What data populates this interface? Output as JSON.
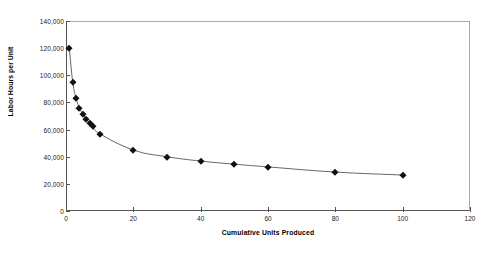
{
  "chart_data": {
    "type": "line",
    "title": "",
    "subtitle": "",
    "xlabel": "Cumulative Units Produced",
    "ylabel": "Labor Hours per Unit",
    "xlim": [
      0,
      120
    ],
    "ylim": [
      0,
      140000
    ],
    "xticks": [
      0,
      20,
      40,
      60,
      80,
      100,
      120
    ],
    "xtick_labels": [
      "0",
      "20",
      "40",
      "60",
      "80",
      "100",
      "120"
    ],
    "yticks": [
      0,
      20000,
      40000,
      60000,
      80000,
      100000,
      120000,
      140000
    ],
    "ytick_labels": [
      "0",
      "20,000",
      "40,000",
      "60,000",
      "80,000",
      "100,000",
      "120,000",
      "140,000"
    ],
    "grid": false,
    "legend": null,
    "legend_position": "none",
    "marker": "diamond",
    "marker_color": "#111111",
    "line_color": "#555555",
    "series": [
      {
        "name": "Labor Hours per Unit",
        "x": [
          1,
          2,
          3,
          4,
          5,
          6,
          7,
          8,
          10,
          20,
          30,
          40,
          50,
          60,
          80,
          100
        ],
        "values": [
          120000,
          95000,
          83000,
          76000,
          71500,
          68000,
          65000,
          62500,
          57000,
          45000,
          40000,
          36800,
          34500,
          32500,
          28700,
          26500
        ]
      }
    ]
  },
  "axes": {
    "x_title": "Cumulative Units Produced",
    "y_title": "Labor Hours per Unit"
  }
}
